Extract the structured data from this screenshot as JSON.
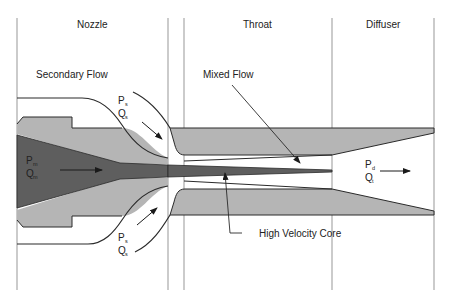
{
  "diagram": {
    "type": "ejector cross-section",
    "colors": {
      "background": "#ffffff",
      "body_gray": "#b5b5b5",
      "motive_dark": "#5e5e5e",
      "outline": "#2a2a2a",
      "divider": "#a8a8a8"
    },
    "sections": [
      {
        "id": "nozzle",
        "label": "Nozzle"
      },
      {
        "id": "throat",
        "label": "Throat"
      },
      {
        "id": "diffuser",
        "label": "Diffuser"
      }
    ],
    "labels": {
      "secondary_flow": "Secondary Flow",
      "mixed_flow": "Mixed Flow",
      "high_velocity_core": "High Velocity Core"
    },
    "streams": {
      "motive": {
        "p": "P",
        "p_sub": "m",
        "q": "Q",
        "q_sub": "m"
      },
      "secondary_top": {
        "p": "P",
        "p_sub": "s",
        "q": "Q",
        "q_sub": "s"
      },
      "secondary_bottom": {
        "p": "P",
        "p_sub": "s",
        "q": "Q",
        "q_sub": "s"
      },
      "discharge": {
        "p": "P",
        "p_sub": "d",
        "q": "Q",
        "q_sub": "t"
      }
    }
  }
}
